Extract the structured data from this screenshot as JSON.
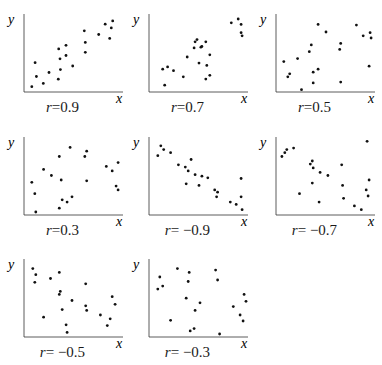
{
  "chart_data": [
    {
      "type": "scatter",
      "title": "r=0.9",
      "label": "r=0.9",
      "r": 0.9,
      "xlabel": "x",
      "ylabel": "y",
      "points": [
        [
          8,
          7
        ],
        [
          12.7,
          20.4
        ],
        [
          11.3,
          38.5
        ],
        [
          19.7,
          11.3
        ],
        [
          25.5,
          25.6
        ],
        [
          35,
          16.9
        ],
        [
          37.1,
          29.5
        ],
        [
          36.7,
          43.7
        ],
        [
          35.4,
          56.7
        ],
        [
          42.9,
          61.4
        ],
        [
          42.9,
          48
        ],
        [
          49.7,
          34.2
        ],
        [
          61.5,
          80.5
        ],
        [
          62.6,
          65.3
        ],
        [
          62.6,
          52.3
        ],
        [
          76.2,
          75.7
        ],
        [
          82.9,
          89.2
        ],
        [
          90.5,
          93.5
        ],
        [
          89.1,
          84.4
        ],
        [
          87.4,
          70.5
        ]
      ]
    },
    {
      "type": "scatter",
      "title": "r=0.7",
      "label": "r=0.7",
      "r": 0.7,
      "xlabel": "x",
      "ylabel": "y",
      "points": [
        [
          16,
          9
        ],
        [
          14,
          30
        ],
        [
          19,
          33
        ],
        [
          25,
          28
        ],
        [
          39,
          46
        ],
        [
          62,
          49
        ],
        [
          59,
          35
        ],
        [
          51,
          38
        ],
        [
          62,
          22
        ],
        [
          84,
          91
        ],
        [
          91,
          96
        ],
        [
          94,
          89
        ],
        [
          94,
          78
        ],
        [
          95,
          74
        ],
        [
          58,
          66
        ],
        [
          54,
          60
        ],
        [
          46,
          58
        ],
        [
          47,
          66
        ],
        [
          53,
          59
        ],
        [
          49,
          69
        ],
        [
          58,
          17
        ],
        [
          35,
          20
        ]
      ]
    },
    {
      "type": "scatter",
      "title": "r=0.5",
      "label": "r=0.5",
      "r": 0.5,
      "xlabel": "x",
      "ylabel": "y",
      "points": [
        [
          8,
          40
        ],
        [
          12,
          20
        ],
        [
          14,
          24
        ],
        [
          22,
          44
        ],
        [
          26,
          3
        ],
        [
          34,
          53
        ],
        [
          36,
          62
        ],
        [
          38,
          12
        ],
        [
          38,
          26
        ],
        [
          43,
          30
        ],
        [
          43,
          89
        ],
        [
          51,
          79
        ],
        [
          65,
          56
        ],
        [
          66,
          64
        ],
        [
          66,
          13
        ],
        [
          82,
          88
        ],
        [
          89,
          74
        ],
        [
          96,
          78
        ],
        [
          97,
          71
        ],
        [
          95,
          34
        ]
      ]
    },
    {
      "type": "scatter",
      "title": "r=0.3",
      "label": "r=0.3",
      "r": 0.3,
      "xlabel": "x",
      "ylabel": "y",
      "points": [
        [
          8,
          43
        ],
        [
          11,
          28
        ],
        [
          12,
          4
        ],
        [
          20,
          60
        ],
        [
          28,
          52
        ],
        [
          36,
          77
        ],
        [
          36,
          9
        ],
        [
          38,
          46
        ],
        [
          39,
          20
        ],
        [
          44,
          17
        ],
        [
          47,
          89
        ],
        [
          49,
          24
        ],
        [
          62,
          77
        ],
        [
          64,
          84
        ],
        [
          64,
          45
        ],
        [
          84,
          64
        ],
        [
          90,
          58
        ],
        [
          96,
          69
        ],
        [
          94,
          38
        ],
        [
          96,
          33
        ]
      ]
    },
    {
      "type": "scatter",
      "title": "r=−0.9",
      "label": "r=−0.9",
      "r": -0.9,
      "xlabel": "x",
      "ylabel": "y",
      "points": [
        [
          9,
          78
        ],
        [
          12,
          91
        ],
        [
          15,
          86
        ],
        [
          22,
          82
        ],
        [
          30,
          66
        ],
        [
          37,
          63
        ],
        [
          40,
          58
        ],
        [
          38,
          41
        ],
        [
          43,
          73
        ],
        [
          47,
          53
        ],
        [
          51,
          39
        ],
        [
          54,
          51
        ],
        [
          60,
          49
        ],
        [
          67,
          33
        ],
        [
          70,
          30
        ],
        [
          69,
          24
        ],
        [
          83,
          17
        ],
        [
          89,
          14
        ],
        [
          94,
          24
        ],
        [
          95,
          7
        ],
        [
          94,
          48
        ]
      ]
    },
    {
      "type": "scatter",
      "title": "r=−0.7",
      "label": "r=−0.7",
      "r": -0.7,
      "xlabel": "x",
      "ylabel": "y",
      "points": [
        [
          6,
          77
        ],
        [
          9,
          82
        ],
        [
          11,
          86
        ],
        [
          18,
          88
        ],
        [
          24,
          28
        ],
        [
          35,
          67
        ],
        [
          37,
          71
        ],
        [
          38,
          62
        ],
        [
          37,
          42
        ],
        [
          45,
          56
        ],
        [
          44,
          17
        ],
        [
          53,
          52
        ],
        [
          67,
          66
        ],
        [
          68,
          39
        ],
        [
          69,
          22
        ],
        [
          80,
          12
        ],
        [
          87,
          7
        ],
        [
          93,
          97
        ],
        [
          95,
          46
        ],
        [
          92,
          33
        ],
        [
          94,
          25
        ]
      ]
    },
    {
      "type": "scatter",
      "title": "r=−0.5",
      "label": "r=−0.5",
      "r": -0.5,
      "xlabel": "x",
      "ylabel": "y",
      "points": [
        [
          9,
          90
        ],
        [
          12,
          82
        ],
        [
          11,
          72
        ],
        [
          20,
          26
        ],
        [
          27,
          77
        ],
        [
          36,
          56
        ],
        [
          37,
          60
        ],
        [
          36,
          85
        ],
        [
          39,
          36
        ],
        [
          43,
          16
        ],
        [
          44,
          6
        ],
        [
          49,
          48
        ],
        [
          63,
          70
        ],
        [
          63,
          41
        ],
        [
          64,
          35
        ],
        [
          78,
          29
        ],
        [
          85,
          15
        ],
        [
          90,
          53
        ],
        [
          93,
          43
        ],
        [
          88,
          24
        ]
      ]
    },
    {
      "type": "scatter",
      "title": "r=−0.3",
      "label": "r=−0.3",
      "r": -0.3,
      "xlabel": "x",
      "ylabel": "y",
      "points": [
        [
          9,
          63
        ],
        [
          11,
          79
        ],
        [
          14,
          67
        ],
        [
          22,
          22
        ],
        [
          29,
          90
        ],
        [
          38,
          51
        ],
        [
          40,
          73
        ],
        [
          41,
          85
        ],
        [
          42,
          8
        ],
        [
          46,
          11
        ],
        [
          47,
          35
        ],
        [
          52,
          45
        ],
        [
          68,
          88
        ],
        [
          70,
          75
        ],
        [
          72,
          4
        ],
        [
          86,
          40
        ],
        [
          93,
          29
        ],
        [
          97,
          56
        ],
        [
          99,
          47
        ],
        [
          96,
          21
        ]
      ]
    }
  ],
  "panels": [
    {
      "r_prefix": "r",
      "r_value": "=0.9"
    },
    {
      "r_prefix": "r",
      "r_value": "=0.7"
    },
    {
      "r_prefix": "r",
      "r_value": "=0.5"
    },
    {
      "r_prefix": "r",
      "r_value": "=0.3"
    },
    {
      "r_prefix": "r",
      "r_value": "= −0.9"
    },
    {
      "r_prefix": "r",
      "r_value": "= −0.7"
    },
    {
      "r_prefix": "r",
      "r_value": "= −0.5"
    },
    {
      "r_prefix": "r",
      "r_value": "= −0.3"
    }
  ],
  "axes": {
    "x_label": "x",
    "y_label": "y"
  }
}
